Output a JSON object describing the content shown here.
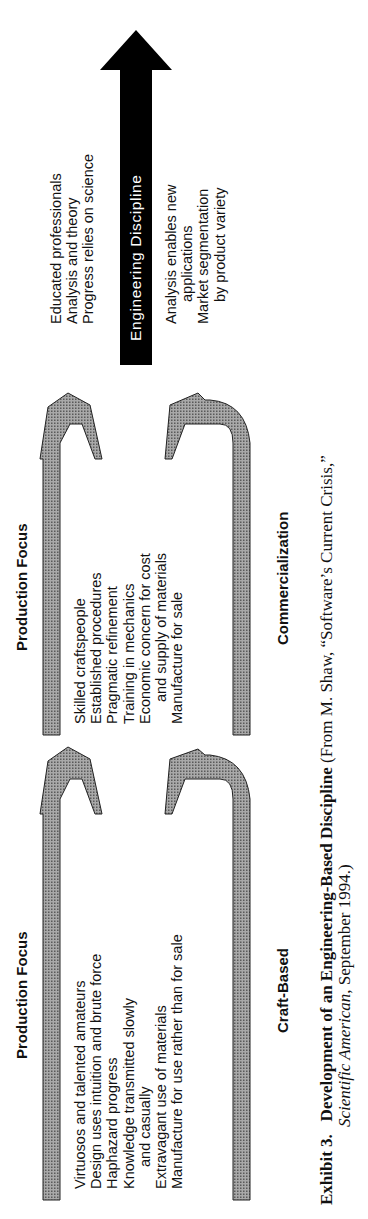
{
  "diagram": {
    "stages": [
      {
        "id": "craft",
        "heading": "Production Focus",
        "items": [
          {
            "text": "Virtuosos and talented amateurs",
            "indent": false
          },
          {
            "text": "Design uses intuition and brute force",
            "indent": false
          },
          {
            "text": "Haphazard progress",
            "indent": false
          },
          {
            "text": "Knowledge transmitted slowly",
            "indent": false
          },
          {
            "text": "and casually",
            "indent": true
          },
          {
            "text": "Extravagant use of materials",
            "indent": false
          },
          {
            "text": "Manufacture for use rather than for sale",
            "indent": false
          }
        ],
        "label": "Craft-Based"
      },
      {
        "id": "commercial",
        "heading": "Production Focus",
        "items": [
          {
            "text": "Skilled craftspeople",
            "indent": false
          },
          {
            "text": "Established procedures",
            "indent": false
          },
          {
            "text": "Pragmatic refinement",
            "indent": false
          },
          {
            "text": "Training in mechanics",
            "indent": false
          },
          {
            "text": "Economic concern for cost",
            "indent": false
          },
          {
            "text": "and supply of materials",
            "indent": true
          },
          {
            "text": "Manufacture for sale",
            "indent": false
          }
        ],
        "label": "Commercialization"
      },
      {
        "id": "engineering",
        "arrow_label": "Engineering Discipline",
        "items_above": [
          {
            "text": "Educated professionals",
            "indent": false
          },
          {
            "text": "Analysis and theory",
            "indent": false
          },
          {
            "text": "Progress relies on science",
            "indent": false
          }
        ],
        "items_below": [
          {
            "text": "Analysis enables new",
            "indent": false
          },
          {
            "text": "applications",
            "indent": true
          },
          {
            "text": "Market segmentation",
            "indent": false
          },
          {
            "text": "by product variety",
            "indent": true
          }
        ]
      }
    ],
    "caption": {
      "number": "Exhibit 3.",
      "title": "Development of an Engineering-Based Discipline",
      "source_line1": " (From M. Shaw, “Software’s Current Crisis,”",
      "source_journal": "Scientific American",
      "source_date": ", September 1994.)"
    },
    "colors": {
      "bracket_fill": "#8a8a8a",
      "bracket_stroke": "#222222",
      "arrow_fill": "#000000",
      "text": "#111111",
      "background": "#ffffff"
    }
  }
}
